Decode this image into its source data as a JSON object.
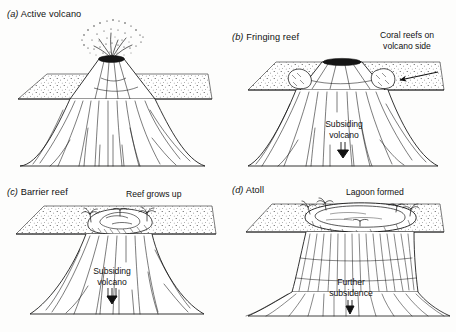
{
  "figure": {
    "title_visible": false,
    "background_color": "#fdfdfc",
    "ink_color": "#111111",
    "panel_count": 4
  },
  "panels": [
    {
      "id": "a",
      "index_label": "(a)",
      "caption": "Active volcano",
      "annotations": []
    },
    {
      "id": "b",
      "index_label": "(b)",
      "caption": "Fringing reef",
      "annotations": [
        {
          "name": "coral-reefs-label",
          "line1": "Coral reefs on",
          "line2": "volcano side"
        },
        {
          "name": "subsiding-volcano-label",
          "line1": "Subsiding",
          "line2": "volcano"
        }
      ]
    },
    {
      "id": "c",
      "index_label": "(c)",
      "caption": "Barrier reef",
      "annotations": [
        {
          "name": "reef-grows-up-label",
          "line1": "Reef grows up",
          "line2": ""
        },
        {
          "name": "subsiding-volcano-label",
          "line1": "Subsiding",
          "line2": "volcano"
        }
      ]
    },
    {
      "id": "d",
      "index_label": "(d)",
      "caption": "Atoll",
      "annotations": [
        {
          "name": "lagoon-formed-label",
          "line1": "Lagoon formed",
          "line2": ""
        },
        {
          "name": "further-subsidence-label",
          "line1": "Further",
          "line2": "subsidence"
        }
      ]
    }
  ],
  "labels": {
    "a_idx": "(a)",
    "a_text": "Active volcano",
    "b_idx": "(b)",
    "b_text": "Fringing reef",
    "b_coral_1": "Coral reefs on",
    "b_coral_2": "volcano side",
    "b_subs_1": "Subsiding",
    "b_subs_2": "volcano",
    "c_idx": "(c)",
    "c_text": "Barrier reef",
    "c_reef": "Reef grows up",
    "c_subs_1": "Subsiding",
    "c_subs_2": "volcano",
    "d_idx": "(d)",
    "d_text": "Atoll",
    "d_lagoon": "Lagoon formed",
    "d_subs_1": "Further",
    "d_subs_2": "subsidence"
  }
}
